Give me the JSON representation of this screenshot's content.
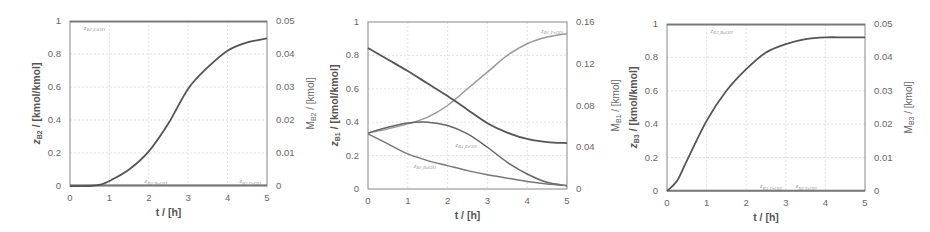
{
  "chart_data": [
    {
      "type": "line",
      "title": "",
      "xlabel": "t / [h]",
      "ylabel": "z_B2 / [kmol/kmol]",
      "ylabel_main": "z",
      "ylabel_sub": "B2",
      "ylabel_rest": " / [kmol/kmol]",
      "y2label_main": "M",
      "y2label_sub": "B2",
      "y2label_rest": " / [kmol]",
      "xlim": [
        0,
        5
      ],
      "ylim": [
        0,
        1
      ],
      "y2lim": [
        0,
        0.05
      ],
      "xticks": [
        "0",
        "1",
        "2",
        "3",
        "4",
        "5"
      ],
      "yticks": [
        "0",
        "0.2",
        "0.4",
        "0.6",
        "0.8",
        "1"
      ],
      "y2ticks": [
        "0",
        "0.01",
        "0.02",
        "0.03",
        "0.04",
        "0.05"
      ],
      "grid": true,
      "series": [
        {
          "name": "z_B2,EtOH",
          "axis": "left",
          "color": "#777777",
          "x": [
            0,
            1,
            2,
            3,
            4,
            5
          ],
          "y": [
            0.995,
            0.995,
            0.995,
            0.995,
            0.995,
            0.995
          ]
        },
        {
          "name": "z_B2,BuOH",
          "axis": "left",
          "color": "#777777",
          "x": [
            0,
            1,
            2,
            3,
            4,
            5
          ],
          "y": [
            0.005,
            0.005,
            0.005,
            0.005,
            0.005,
            0.005
          ]
        },
        {
          "name": "z_B2,PrOH",
          "axis": "left",
          "color": "#777777",
          "x": [
            0,
            1,
            2,
            3,
            4,
            5
          ],
          "y": [
            0.003,
            0.003,
            0.003,
            0.003,
            0.003,
            0.003
          ]
        },
        {
          "name": "M_B2",
          "axis": "right",
          "color": "#555555",
          "x": [
            0,
            0.5,
            0.8,
            1,
            1.5,
            2,
            2.5,
            3,
            3.5,
            4,
            4.5,
            5
          ],
          "y": [
            0,
            0,
            0.0005,
            0.0015,
            0.005,
            0.0105,
            0.019,
            0.0295,
            0.036,
            0.041,
            0.0435,
            0.0447
          ]
        }
      ],
      "annotations": [
        "z_B2,EtOH",
        "z_B2,BuOH",
        "z_B2,PrOH"
      ]
    },
    {
      "type": "line",
      "title": "",
      "xlabel": "t / [h]",
      "ylabel": "z_B1 / [kmol/kmol]",
      "ylabel_main": "z",
      "ylabel_sub": "B1",
      "ylabel_rest": " / [kmol/kmol]",
      "y2label_main": "M",
      "y2label_sub": "B1",
      "y2label_rest": " / [kmol]",
      "xlim": [
        0,
        5
      ],
      "ylim": [
        0,
        1
      ],
      "y2lim": [
        0,
        0.16
      ],
      "xticks": [
        "0",
        "1",
        "2",
        "3",
        "4",
        "5"
      ],
      "yticks": [
        "0",
        "0.2",
        "0.4",
        "0.6",
        "0.8",
        "1"
      ],
      "y2ticks": [
        "0",
        "0.04",
        "0.08",
        "0.12",
        "0.16"
      ],
      "grid": true,
      "series": [
        {
          "name": "z_B1,PrOH",
          "axis": "left",
          "color": "#999999",
          "x": [
            0,
            0.5,
            1,
            1.5,
            2,
            2.5,
            3,
            3.5,
            4,
            4.5,
            5
          ],
          "y": [
            0.335,
            0.36,
            0.39,
            0.43,
            0.5,
            0.6,
            0.7,
            0.8,
            0.87,
            0.91,
            0.93
          ]
        },
        {
          "name": "z_B1,EtOH",
          "axis": "left",
          "color": "#666666",
          "x": [
            0,
            0.5,
            1,
            1.5,
            2,
            2.5,
            3,
            3.5,
            4,
            4.5,
            5
          ],
          "y": [
            0.335,
            0.37,
            0.395,
            0.4,
            0.38,
            0.33,
            0.25,
            0.16,
            0.09,
            0.04,
            0.02
          ]
        },
        {
          "name": "z_B1,BuOH",
          "axis": "left",
          "color": "#777777",
          "x": [
            0,
            0.5,
            1,
            1.5,
            2,
            2.5,
            3,
            3.5,
            4,
            4.5,
            5
          ],
          "y": [
            0.33,
            0.27,
            0.21,
            0.17,
            0.14,
            0.11,
            0.085,
            0.065,
            0.045,
            0.03,
            0.02
          ]
        },
        {
          "name": "M_B1",
          "axis": "right",
          "color": "#555555",
          "x": [
            0,
            0.5,
            1,
            1.5,
            2,
            2.5,
            3,
            3.5,
            4,
            4.5,
            5
          ],
          "y": [
            0.135,
            0.124,
            0.113,
            0.101,
            0.089,
            0.076,
            0.063,
            0.054,
            0.048,
            0.045,
            0.044
          ]
        }
      ],
      "annotations": [
        "z_B1,PrOH",
        "z_B1,EtOH",
        "z_B1,BuOH"
      ]
    },
    {
      "type": "line",
      "title": "",
      "xlabel": "t / [h]",
      "ylabel": "z_B3 / [kmol/kmol]",
      "ylabel_main": "z",
      "ylabel_sub": "B3",
      "ylabel_rest": " / [kmol/kmol]",
      "y2label_main": "M",
      "y2label_sub": "B3",
      "y2label_rest": " / [kmol]",
      "xlim": [
        0,
        5
      ],
      "ylim": [
        0,
        1
      ],
      "y2lim": [
        0,
        0.05
      ],
      "xticks": [
        "0",
        "1",
        "2",
        "3",
        "4",
        "5"
      ],
      "yticks": [
        "0",
        "0.2",
        "0.4",
        "0.6",
        "0.8",
        "1"
      ],
      "y2ticks": [
        "0",
        "0.01",
        "0.02",
        "0.03",
        "0.04",
        "0.05"
      ],
      "grid": true,
      "series": [
        {
          "name": "z_B3,BuOH",
          "axis": "left",
          "color": "#777777",
          "x": [
            0,
            1,
            2,
            3,
            4,
            5
          ],
          "y": [
            0.995,
            0.995,
            0.995,
            0.995,
            0.995,
            0.995
          ]
        },
        {
          "name": "z_B3,PrOH",
          "axis": "left",
          "color": "#777777",
          "x": [
            0,
            1,
            2,
            3,
            4,
            5
          ],
          "y": [
            0.003,
            0.003,
            0.003,
            0.003,
            0.003,
            0.003
          ]
        },
        {
          "name": "z_B3,EtOH",
          "axis": "left",
          "color": "#777777",
          "x": [
            0,
            1,
            2,
            3,
            4,
            5
          ],
          "y": [
            0.002,
            0.002,
            0.002,
            0.002,
            0.002,
            0.002
          ]
        },
        {
          "name": "M_B3",
          "axis": "right",
          "color": "#555555",
          "x": [
            0,
            0.25,
            0.5,
            1,
            1.5,
            2,
            2.5,
            3,
            3.5,
            4,
            4.5,
            5
          ],
          "y": [
            0,
            0.003,
            0.009,
            0.021,
            0.03,
            0.0365,
            0.0415,
            0.044,
            0.0455,
            0.046,
            0.046,
            0.046
          ]
        }
      ],
      "annotations": [
        "z_B3,BuOH",
        "z_B3,PrOH",
        "z_B3,EtOH"
      ]
    }
  ],
  "panels": [
    {
      "labels": [
        {
          "main": "z",
          "sub": "B2,EtOH",
          "x": 14,
          "y": 0.965
        },
        {
          "main": "z",
          "sub": "B2,BuOH",
          "x": 1.9,
          "y": 0.035
        },
        {
          "main": "z",
          "sub": "B2,PrOH",
          "x": 4.3,
          "y": 0.035
        }
      ]
    },
    {
      "labels": [
        {
          "main": "z",
          "sub": "B1,PrOH",
          "x": 4.35,
          "y": 0.955
        },
        {
          "main": "z",
          "sub": "B1,EtOH",
          "x": 2.2,
          "y": 0.27
        },
        {
          "main": "z",
          "sub": "B1,BuOH",
          "x": 1.15,
          "y": 0.145
        }
      ]
    },
    {
      "labels": [
        {
          "main": "z",
          "sub": "B3,BuOH",
          "x": 1.1,
          "y": 0.965
        },
        {
          "main": "z",
          "sub": "B3,PrOH",
          "x": 2.35,
          "y": 0.035
        },
        {
          "main": "z",
          "sub": "B3,EtOH",
          "x": 3.25,
          "y": 0.035
        }
      ]
    }
  ]
}
